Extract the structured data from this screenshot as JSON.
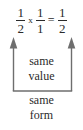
{
  "figure": {
    "type": "math-annotation-diagram",
    "background_color": "#ffffff",
    "ink_color": "#2b2b2b"
  },
  "equation": {
    "expression": "1/2 x 1/1 = 1/2",
    "terms": [
      {
        "role": "first-factor",
        "numerator": "1",
        "denominator": "2"
      },
      {
        "role": "second-factor",
        "numerator": "1",
        "denominator": "1"
      },
      {
        "role": "product",
        "numerator": "1",
        "denominator": "2"
      }
    ],
    "operators": {
      "multiply": "x",
      "equals": "="
    },
    "fraction_1": {
      "numerator": "1",
      "denominator": "2"
    },
    "fraction_2": {
      "numerator": "1",
      "denominator": "1"
    },
    "fraction_3": {
      "numerator": "1",
      "denominator": "2"
    }
  },
  "annotations": {
    "inside_bracket": {
      "line1": "same",
      "line2": "value"
    },
    "below_bracket": {
      "line1": "same",
      "line2": "form"
    }
  }
}
